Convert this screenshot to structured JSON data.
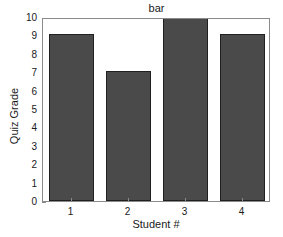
{
  "chart_data": {
    "type": "bar",
    "title": "bar",
    "xlabel": "Student #",
    "ylabel": "Quiz Grade",
    "categories": [
      "1",
      "2",
      "3",
      "4"
    ],
    "values": [
      9,
      7,
      10,
      9
    ],
    "xtick_labels": [
      "1",
      "2",
      "3",
      "4"
    ],
    "ytick_labels": [
      "0",
      "1",
      "2",
      "3",
      "4",
      "5",
      "6",
      "7",
      "8",
      "9",
      "10"
    ],
    "ytick_values": [
      0,
      1,
      2,
      3,
      4,
      5,
      6,
      7,
      8,
      9,
      10
    ],
    "ylim": [
      0,
      10
    ],
    "xlim": [
      0.5,
      4.5
    ],
    "grid": false,
    "legend": null,
    "bar_color": "#4a4a4a",
    "bar_edge_color": "#202020",
    "bar_width": 0.8,
    "axes_color": "#8a8a8a",
    "background": "#ffffff"
  }
}
